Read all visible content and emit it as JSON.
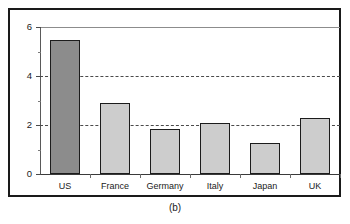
{
  "caption": "(b)",
  "chart_data": {
    "type": "bar",
    "title": "",
    "subtitle": "",
    "xlabel": "",
    "ylabel": "",
    "categories": [
      "US",
      "France",
      "Germany",
      "Italy",
      "Japan",
      "UK"
    ],
    "values": [
      5.45,
      2.9,
      1.85,
      2.1,
      1.25,
      2.3
    ],
    "series": [
      {
        "name": "",
        "values": [
          5.45,
          2.9,
          1.85,
          2.1,
          1.25,
          2.3
        ]
      }
    ],
    "ylim": [
      0,
      6
    ],
    "ytick_labels": [
      "0",
      "2",
      "4",
      "6"
    ],
    "ytick_values": [
      0,
      2,
      4,
      6
    ],
    "yminor_tick_values": [
      1,
      3,
      5
    ],
    "gridlines": [
      2,
      4,
      6
    ],
    "grid": true,
    "legend": null,
    "legend_position": "none",
    "annotations": [],
    "colors": {
      "bar_default": "#cdcdcd",
      "bar_highlight": "#8c8c8c",
      "bar_border": "#1c1c1c",
      "grid": "#4a4a4a",
      "axis": "#3a3a3a",
      "frame": "#1a1a1a",
      "background": "#ffffff",
      "text": "#1a1a1a"
    },
    "highlight_category": "US"
  }
}
